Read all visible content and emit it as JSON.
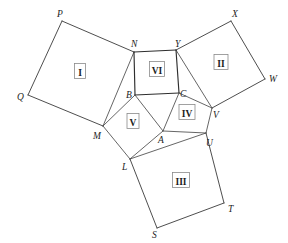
{
  "figure": {
    "type": "geometric-diagram",
    "canvas": {
      "width": 288,
      "height": 243,
      "background": "#ffffff"
    },
    "stroke_colors": {
      "outer_edge": "#3a3a3a",
      "inner_edge": "#4a4a4a",
      "center_square": "#2e2e2e",
      "label_box": "#8a8a8a",
      "text": "#1c1c1c"
    }
  },
  "vertices": [
    {
      "id": "P",
      "label": "P",
      "x": 62,
      "y": 21,
      "label_x": 57,
      "label_y": 17,
      "kind": "outer"
    },
    {
      "id": "Q",
      "label": "Q",
      "x": 28,
      "y": 95,
      "label_x": 17,
      "label_y": 100,
      "kind": "outer"
    },
    {
      "id": "M",
      "label": "M",
      "x": 103,
      "y": 126,
      "label_x": 93,
      "label_y": 139,
      "kind": "inner"
    },
    {
      "id": "N",
      "label": "N",
      "x": 134,
      "y": 52,
      "label_x": 131,
      "label_y": 47,
      "kind": "inner"
    },
    {
      "id": "X",
      "label": "X",
      "x": 231,
      "y": 21,
      "label_x": 232,
      "label_y": 17,
      "kind": "outer"
    },
    {
      "id": "W",
      "label": "W",
      "x": 265,
      "y": 79,
      "label_x": 269,
      "label_y": 82,
      "kind": "outer"
    },
    {
      "id": "V",
      "label": "V",
      "x": 212,
      "y": 108,
      "label_x": 213,
      "label_y": 118,
      "kind": "inner"
    },
    {
      "id": "Y",
      "label": "Y",
      "x": 176,
      "y": 50,
      "label_x": 175,
      "label_y": 47,
      "kind": "inner"
    },
    {
      "id": "S",
      "label": "S",
      "x": 157,
      "y": 228,
      "label_x": 152,
      "label_y": 238,
      "kind": "outer"
    },
    {
      "id": "T",
      "label": "T",
      "x": 224,
      "y": 203,
      "label_x": 228,
      "label_y": 212,
      "kind": "outer"
    },
    {
      "id": "U",
      "label": "U",
      "x": 206,
      "y": 133,
      "label_x": 206,
      "label_y": 146,
      "kind": "inner"
    },
    {
      "id": "L",
      "label": "L",
      "x": 130,
      "y": 159,
      "label_x": 122,
      "label_y": 170,
      "kind": "inner"
    },
    {
      "id": "A",
      "label": "A",
      "x": 163,
      "y": 131,
      "label_x": 158,
      "label_y": 143,
      "kind": "inner"
    },
    {
      "id": "B",
      "label": "B",
      "x": 135,
      "y": 95,
      "label_x": 126,
      "label_y": 98,
      "kind": "inner"
    },
    {
      "id": "C",
      "label": "C",
      "x": 179,
      "y": 93,
      "label_x": 180,
      "label_y": 97,
      "kind": "inner"
    }
  ],
  "regions": [
    {
      "id": "I",
      "label": "I",
      "polygon": "P,Q,M,N",
      "label_x": 80,
      "label_y": 72,
      "box_w": 11,
      "box_h": 15
    },
    {
      "id": "II",
      "label": "II",
      "polygon": "Y,X,W,V",
      "label_x": 221,
      "label_y": 63,
      "box_w": 14,
      "box_h": 15
    },
    {
      "id": "III",
      "label": "III",
      "polygon": "L,U,T,S",
      "label_x": 181,
      "label_y": 181,
      "box_w": 17,
      "box_h": 15
    },
    {
      "id": "IV",
      "label": "IV",
      "polygon": "C,V,U,A",
      "label_x": 187,
      "label_y": 113,
      "box_w": 16,
      "box_h": 15
    },
    {
      "id": "V",
      "label": "V",
      "polygon": "B,M,L,A",
      "label_x": 133,
      "label_y": 122,
      "box_w": 12,
      "box_h": 15
    },
    {
      "id": "VI",
      "label": "VI",
      "polygon": "N,Y,C,B",
      "label_x": 157,
      "label_y": 70,
      "box_w": 15,
      "box_h": 15
    }
  ],
  "edges": [
    {
      "from": "P",
      "to": "Q",
      "class": "outer"
    },
    {
      "from": "Q",
      "to": "M",
      "class": "outer"
    },
    {
      "from": "P",
      "to": "N",
      "class": "outer"
    },
    {
      "from": "M",
      "to": "N",
      "class": "inner"
    },
    {
      "from": "Y",
      "to": "X",
      "class": "outer"
    },
    {
      "from": "X",
      "to": "W",
      "class": "outer"
    },
    {
      "from": "W",
      "to": "V",
      "class": "outer"
    },
    {
      "from": "Y",
      "to": "V",
      "class": "inner"
    },
    {
      "from": "L",
      "to": "S",
      "class": "outer"
    },
    {
      "from": "S",
      "to": "T",
      "class": "outer"
    },
    {
      "from": "T",
      "to": "U",
      "class": "outer"
    },
    {
      "from": "L",
      "to": "U",
      "class": "inner"
    },
    {
      "from": "N",
      "to": "Y",
      "class": "center"
    },
    {
      "from": "Y",
      "to": "C",
      "class": "center"
    },
    {
      "from": "C",
      "to": "B",
      "class": "center"
    },
    {
      "from": "B",
      "to": "N",
      "class": "center"
    },
    {
      "from": "B",
      "to": "M",
      "class": "inner"
    },
    {
      "from": "M",
      "to": "L",
      "class": "inner"
    },
    {
      "from": "L",
      "to": "A",
      "class": "inner"
    },
    {
      "from": "A",
      "to": "B",
      "class": "inner"
    },
    {
      "from": "C",
      "to": "V",
      "class": "inner"
    },
    {
      "from": "V",
      "to": "U",
      "class": "inner"
    },
    {
      "from": "U",
      "to": "A",
      "class": "inner"
    },
    {
      "from": "A",
      "to": "C",
      "class": "inner"
    }
  ]
}
